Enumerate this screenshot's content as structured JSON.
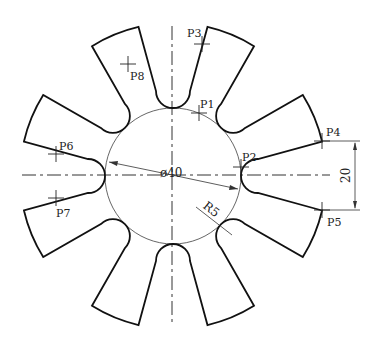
{
  "drawing": {
    "center": [
      173,
      176
    ],
    "circle_label": "ø40",
    "radius_label": "R5",
    "dimension_label": "20",
    "tooth_count": 8,
    "points": [
      {
        "name": "P1",
        "x": 199,
        "y": 113,
        "lx": 200,
        "ly": 108
      },
      {
        "name": "P2",
        "x": 241,
        "y": 167,
        "lx": 242,
        "ly": 161
      },
      {
        "name": "P3",
        "x": 202,
        "y": 44,
        "lx": 187,
        "ly": 37
      },
      {
        "name": "P4",
        "x": 322,
        "y": 141,
        "lx": 326,
        "ly": 136
      },
      {
        "name": "P5",
        "x": 322,
        "y": 210,
        "lx": 327,
        "ly": 226
      },
      {
        "name": "P6",
        "x": 56,
        "y": 154,
        "lx": 59,
        "ly": 150
      },
      {
        "name": "P7",
        "x": 56,
        "y": 198,
        "lx": 56,
        "ly": 217
      },
      {
        "name": "P8",
        "x": 128,
        "y": 64,
        "lx": 130,
        "ly": 80
      }
    ]
  }
}
